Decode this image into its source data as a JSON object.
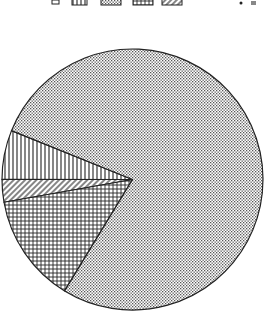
{
  "chart_data": {
    "type": "pie",
    "title": "",
    "legend_position": "top",
    "legend_labels_visible": false,
    "slices": [
      {
        "name": "dotted",
        "pattern": "dots",
        "percent": 77.6
      },
      {
        "name": "vertical-lines",
        "pattern": "vertical",
        "percent": 6.1
      },
      {
        "name": "diagonal-lines",
        "pattern": "diagonal",
        "percent": 2.8
      },
      {
        "name": "grid",
        "pattern": "grid",
        "percent": 13.5
      }
    ],
    "legend": [
      {
        "pattern": "vertical"
      },
      {
        "pattern": "dots"
      },
      {
        "pattern": "grid"
      },
      {
        "pattern": "diagonal"
      }
    ],
    "start_angle_deg": 158,
    "direction": "counterclockwise",
    "colors": {
      "stroke": "#222222",
      "background": "#ffffff"
    }
  }
}
